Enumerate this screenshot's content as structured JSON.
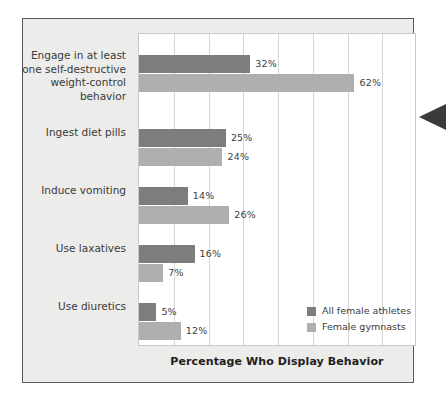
{
  "chart_data": {
    "type": "bar",
    "orientation": "horizontal",
    "title": "",
    "xlabel": "Percentage Who Display Behavior",
    "ylabel": "",
    "xlim": [
      0,
      80
    ],
    "xtick_step": 10,
    "grid": true,
    "legend_position": "inside-bottom-right",
    "categories": [
      "Engage in at least\none self-destructive\nweight-control\nbehavior",
      "Ingest diet pills",
      "Induce vomiting",
      "Use laxatives",
      "Use diuretics"
    ],
    "series": [
      {
        "name": "All female athletes",
        "color": "#7d7d7d",
        "values": [
          32,
          25,
          14,
          16,
          5
        ],
        "labels": [
          "32%",
          "25%",
          "14%",
          "16%",
          "5%"
        ]
      },
      {
        "name": "Female gymnasts",
        "color": "#afafaf",
        "values": [
          62,
          24,
          26,
          7,
          12
        ],
        "labels": [
          "62%",
          "24%",
          "26%",
          "7%",
          "12%"
        ]
      }
    ]
  },
  "figure": {
    "panel_background": "#ececeb",
    "panel_border": "#58595b",
    "plot_background": "#ffffff",
    "gridline_color": "#d5d5d3"
  },
  "pointer": {
    "name": "left-pointing-triangle",
    "color": "#3b3b3b"
  }
}
